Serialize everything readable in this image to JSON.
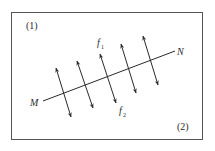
{
  "diagram": {
    "region_labels": {
      "top_left": "(1)",
      "bottom_right": "(2)"
    },
    "line": {
      "start_label": "M",
      "end_label": "N"
    },
    "forces": {
      "upper_label_base": "f",
      "upper_label_sub": "1",
      "lower_label_base": "f",
      "lower_label_sub": "2"
    },
    "arrow_count": 5,
    "colors": {
      "stroke": "#2a2a2a",
      "frame": "#555555",
      "background": "#ffffff"
    }
  }
}
